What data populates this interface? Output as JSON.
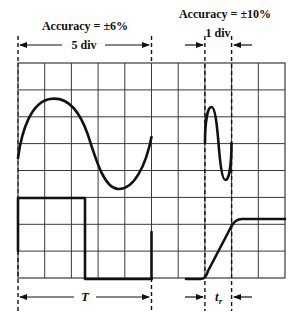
{
  "figure": {
    "type": "oscilloscope-measurement-diagram",
    "grid": {
      "columns": 10,
      "rows": 8,
      "x0": 18,
      "y0": 63,
      "x1": 285,
      "y1": 278,
      "color": "#3a3a3a"
    },
    "ink_color": "#111111",
    "background": "#ffffff"
  },
  "labels": {
    "accuracy_left": "Accuracy = ±6%",
    "span_left": "5 div",
    "accuracy_right": "Accuracy = ±10%",
    "span_right": "1 div",
    "period": "T",
    "rise_time_main": "t",
    "rise_time_sub": "r"
  },
  "traces": [
    {
      "name": "slow-sine",
      "description": "one full sine cycle spanning 5 divisions",
      "x_start_div": 0,
      "x_end_div": 5,
      "amplitude_div": 1.7,
      "center_div_from_top": 3
    },
    {
      "name": "fast-sine",
      "description": "one full sine cycle spanning 1 division",
      "x_start_div": 7,
      "x_end_div": 8,
      "amplitude_div": 1.4,
      "center_div_from_top": 3
    },
    {
      "name": "square-wave",
      "description": "high from div 0 to 2.5, low from 2.5 to 5",
      "high_div_from_top": 5,
      "low_div_from_top": 8
    },
    {
      "name": "rising-edge",
      "description": "step rising between dashed markers",
      "low_div_from_top": 8,
      "high_div_from_top": 5.8,
      "rise_start_div": 7,
      "rise_end_div": 8
    }
  ],
  "measurements": [
    {
      "name": "period-5div",
      "from_div": 0,
      "to_div": 5,
      "label_ref": "labels.span_left"
    },
    {
      "name": "rise-1div",
      "from_div": 7,
      "to_div": 8,
      "label_ref": "labels.span_right"
    }
  ]
}
